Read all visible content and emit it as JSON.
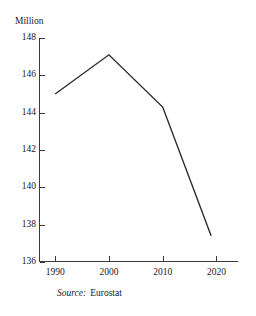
{
  "chart_data": {
    "type": "line",
    "title": "",
    "subtitle": "",
    "xlabel": "",
    "ylabel": "Million",
    "unit_caption": "Million",
    "x": [
      1990,
      2000,
      2010,
      2019
    ],
    "values": [
      145.0,
      147.1,
      144.3,
      137.4
    ],
    "series": [
      {
        "name": "Population",
        "values": [
          145.0,
          147.1,
          144.3,
          137.4
        ]
      }
    ],
    "ytick_labels": [
      "148",
      "146",
      "144",
      "142",
      "140",
      "138",
      "136"
    ],
    "yticks": [
      148,
      146,
      144,
      142,
      140,
      138,
      136
    ],
    "xtick_labels": [
      "1990",
      "2000",
      "2010",
      "2020"
    ],
    "xticks": [
      1990,
      2000,
      2010,
      2020
    ],
    "ylim": [
      136,
      148
    ],
    "xlim": [
      1987,
      2024
    ],
    "grid": false,
    "legend": false,
    "legend_position": "none",
    "line_color": "#2b2b2b",
    "axis_color": "#3a3a3a",
    "background_color": "#ffffff"
  },
  "source": {
    "label": "Source:",
    "value": "Eurostat"
  }
}
